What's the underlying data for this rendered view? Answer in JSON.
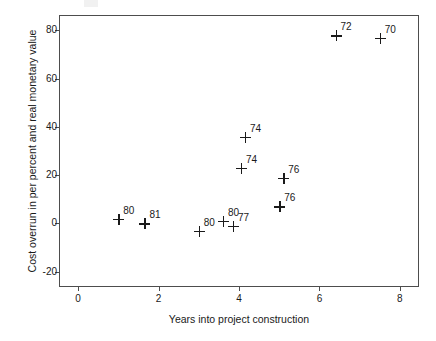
{
  "chart_data": {
    "type": "scatter",
    "title": "",
    "xlabel": "Years into project construction",
    "ylabel": "Cost overrun in per percent and real monetary value",
    "xlim": [
      -0.45,
      8.45
    ],
    "ylim": [
      -26,
      86
    ],
    "xticks": [
      0,
      2,
      4,
      6,
      8
    ],
    "xtick_labels": [
      "0",
      "2",
      "4",
      "6",
      "8"
    ],
    "yticks": [
      -20,
      0,
      20,
      40,
      60,
      80
    ],
    "ytick_labels": [
      "-20",
      "0",
      "20",
      "40",
      "60",
      "80"
    ],
    "grid": false,
    "legend": false,
    "marker": "plus",
    "points": [
      {
        "x": 1.0,
        "y": 2,
        "label": "80"
      },
      {
        "x": 1.65,
        "y": 0,
        "label": "81"
      },
      {
        "x": 3.0,
        "y": -3,
        "label": "80"
      },
      {
        "x": 3.6,
        "y": 1,
        "label": "80"
      },
      {
        "x": 3.85,
        "y": -1,
        "label": "77"
      },
      {
        "x": 4.05,
        "y": 23,
        "label": "74"
      },
      {
        "x": 4.15,
        "y": 36,
        "label": "74"
      },
      {
        "x": 5.0,
        "y": 7,
        "label": "76"
      },
      {
        "x": 5.1,
        "y": 19,
        "label": "76"
      },
      {
        "x": 6.4,
        "y": 78,
        "label": "72"
      },
      {
        "x": 7.5,
        "y": 77,
        "label": "70"
      }
    ],
    "colors": {
      "marker": "#1a1a1a",
      "axis": "#4d4d4d",
      "background": "#ffffff",
      "text": "#1a1a1a"
    }
  }
}
